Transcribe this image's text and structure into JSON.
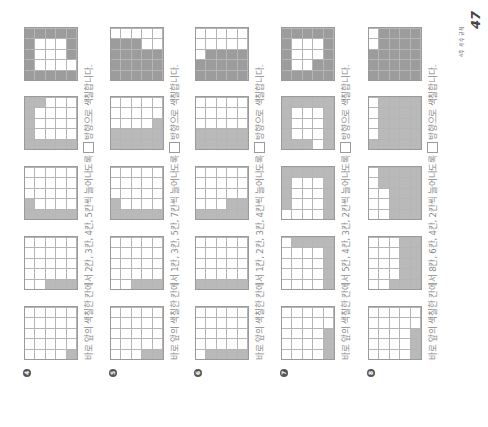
{
  "page": {
    "number": "47",
    "section_label": "4주 개수 규칙"
  },
  "problems": [
    {
      "number": "4",
      "text_before": "바로 앞의 색칠한 칸에서 2칸, 3칸, 4칸, 5칸씩 늘어나도록",
      "direction_icon": "spiral-clockwise-icon",
      "text_after": "방향으로 색칠합니다.",
      "grids": [
        [
          [
            0,
            0,
            0,
            0,
            0
          ],
          [
            0,
            0,
            0,
            0,
            0
          ],
          [
            0,
            0,
            0,
            0,
            0
          ],
          [
            0,
            0,
            0,
            0,
            0
          ],
          [
            1,
            0,
            0,
            0,
            0
          ]
        ],
        [
          [
            0,
            0,
            0,
            0,
            0
          ],
          [
            0,
            0,
            0,
            0,
            0
          ],
          [
            1,
            0,
            0,
            0,
            0
          ],
          [
            1,
            0,
            0,
            0,
            0
          ],
          [
            1,
            0,
            0,
            0,
            0
          ]
        ],
        [
          [
            1,
            1,
            0,
            0,
            0
          ],
          [
            1,
            0,
            0,
            0,
            0
          ],
          [
            1,
            0,
            0,
            0,
            0
          ],
          [
            1,
            0,
            0,
            0,
            0
          ],
          [
            1,
            0,
            0,
            0,
            0
          ]
        ],
        [
          [
            1,
            1,
            1,
            1,
            1
          ],
          [
            1,
            0,
            0,
            0,
            1
          ],
          [
            1,
            0,
            0,
            0,
            0
          ],
          [
            1,
            0,
            0,
            0,
            0
          ],
          [
            1,
            0,
            0,
            0,
            0
          ]
        ],
        [
          [
            2,
            2,
            2,
            2,
            2
          ],
          [
            2,
            0,
            0,
            0,
            2
          ],
          [
            2,
            0,
            0,
            0,
            2
          ],
          [
            2,
            0,
            0,
            0,
            2
          ],
          [
            2,
            0,
            2,
            2,
            2
          ]
        ]
      ]
    },
    {
      "number": "5",
      "text_before": "바로 앞의 색칠한 칸에서 1칸, 3칸, 5칸, 7칸씩 늘어나도록",
      "direction_icon": "zigzag-up-icon",
      "text_after": "방향으로 색칠합니다.",
      "grids": [
        [
          [
            0,
            0,
            0,
            0,
            0
          ],
          [
            0,
            0,
            0,
            0,
            0
          ],
          [
            0,
            0,
            0,
            0,
            0
          ],
          [
            1,
            0,
            0,
            0,
            0
          ],
          [
            1,
            0,
            0,
            0,
            0
          ]
        ],
        [
          [
            0,
            0,
            0,
            0,
            0
          ],
          [
            0,
            0,
            0,
            0,
            0
          ],
          [
            1,
            0,
            0,
            0,
            0
          ],
          [
            1,
            0,
            0,
            0,
            0
          ],
          [
            1,
            0,
            0,
            0,
            0
          ]
        ],
        [
          [
            1,
            1,
            0,
            0,
            0
          ],
          [
            1,
            0,
            0,
            0,
            0
          ],
          [
            1,
            0,
            0,
            0,
            0
          ],
          [
            1,
            0,
            0,
            0,
            0
          ],
          [
            1,
            0,
            0,
            0,
            0
          ]
        ],
        [
          [
            1,
            1,
            0,
            0,
            0
          ],
          [
            1,
            1,
            0,
            0,
            0
          ],
          [
            1,
            1,
            0,
            0,
            0
          ],
          [
            1,
            1,
            0,
            0,
            0
          ],
          [
            1,
            1,
            1,
            0,
            0
          ]
        ],
        [
          [
            2,
            2,
            2,
            2,
            0
          ],
          [
            2,
            2,
            2,
            2,
            0
          ],
          [
            2,
            2,
            2,
            2,
            0
          ],
          [
            2,
            2,
            2,
            0,
            0
          ],
          [
            2,
            2,
            2,
            0,
            0
          ]
        ]
      ]
    },
    {
      "number": "6",
      "text_before": "바로 앞의 색칠한 칸에서 1칸, 2칸, 3칸, 4칸씩 늘어나도록",
      "direction_icon": "zigzag-icon",
      "text_after": "방향으로 색칠합니다.",
      "grids": [
        [
          [
            0,
            0,
            0,
            0,
            0
          ],
          [
            1,
            0,
            0,
            0,
            0
          ],
          [
            1,
            0,
            0,
            0,
            0
          ],
          [
            1,
            0,
            0,
            0,
            0
          ],
          [
            1,
            0,
            0,
            0,
            0
          ]
        ],
        [
          [
            1,
            0,
            0,
            0,
            0
          ],
          [
            1,
            0,
            0,
            0,
            0
          ],
          [
            1,
            0,
            0,
            0,
            0
          ],
          [
            1,
            0,
            0,
            0,
            0
          ],
          [
            1,
            0,
            0,
            0,
            0
          ]
        ],
        [
          [
            1,
            0,
            0,
            0,
            0
          ],
          [
            1,
            0,
            0,
            0,
            0
          ],
          [
            1,
            0,
            0,
            0,
            0
          ],
          [
            1,
            1,
            0,
            0,
            0
          ],
          [
            1,
            1,
            0,
            0,
            0
          ]
        ],
        [
          [
            1,
            1,
            0,
            0,
            0
          ],
          [
            1,
            1,
            0,
            0,
            0
          ],
          [
            1,
            1,
            0,
            0,
            0
          ],
          [
            1,
            1,
            0,
            0,
            0
          ],
          [
            1,
            1,
            0,
            0,
            0
          ]
        ],
        [
          [
            2,
            2,
            0,
            0,
            0
          ],
          [
            2,
            2,
            2,
            0,
            0
          ],
          [
            2,
            2,
            2,
            0,
            0
          ],
          [
            2,
            2,
            2,
            0,
            0
          ],
          [
            2,
            2,
            2,
            0,
            0
          ]
        ]
      ]
    },
    {
      "number": "7",
      "text_before": "바로 앞의 색칠한 칸에서 5칸, 4칸, 3칸, 2칸씩 늘어나도록",
      "direction_icon": "spiral-counterclockwise-icon",
      "text_after": "방향으로 색칠합니다.",
      "grids": [
        [
          [
            0,
            0,
            0,
            0,
            0
          ],
          [
            0,
            0,
            0,
            0,
            0
          ],
          [
            0,
            0,
            0,
            0,
            0
          ],
          [
            0,
            0,
            0,
            0,
            0
          ],
          [
            1,
            1,
            1,
            0,
            0
          ]
        ],
        [
          [
            0,
            0,
            0,
            0,
            0
          ],
          [
            0,
            0,
            0,
            0,
            1
          ],
          [
            0,
            0,
            0,
            0,
            1
          ],
          [
            0,
            0,
            0,
            0,
            1
          ],
          [
            1,
            1,
            1,
            1,
            1
          ]
        ],
        [
          [
            0,
            1,
            1,
            1,
            1
          ],
          [
            0,
            0,
            0,
            0,
            1
          ],
          [
            0,
            0,
            0,
            0,
            1
          ],
          [
            0,
            0,
            0,
            0,
            1
          ],
          [
            1,
            1,
            1,
            1,
            1
          ]
        ],
        [
          [
            1,
            1,
            1,
            1,
            1
          ],
          [
            1,
            0,
            0,
            0,
            1
          ],
          [
            1,
            0,
            0,
            0,
            1
          ],
          [
            0,
            0,
            0,
            0,
            1
          ],
          [
            1,
            1,
            1,
            1,
            1
          ]
        ],
        [
          [
            2,
            2,
            2,
            2,
            2
          ],
          [
            2,
            0,
            0,
            0,
            2
          ],
          [
            2,
            0,
            0,
            0,
            2
          ],
          [
            2,
            2,
            0,
            0,
            2
          ],
          [
            2,
            2,
            2,
            2,
            2
          ]
        ]
      ]
    },
    {
      "number": "8",
      "text_before": "바로 앞의 색칠한 칸에서 8칸, 6칸, 4칸, 2칸씩 늘어나도록",
      "direction_icon": "snake-up-icon",
      "text_after": "방향으로 색칠합니다.",
      "grids": [
        [
          [
            0,
            0,
            0,
            0,
            0
          ],
          [
            0,
            0,
            0,
            0,
            0
          ],
          [
            0,
            0,
            0,
            0,
            0
          ],
          [
            0,
            0,
            0,
            0,
            0
          ],
          [
            1,
            1,
            1,
            0,
            0
          ]
        ],
        [
          [
            0,
            0,
            0,
            0,
            0
          ],
          [
            0,
            0,
            0,
            0,
            0
          ],
          [
            1,
            0,
            0,
            0,
            0
          ],
          [
            1,
            1,
            1,
            1,
            1
          ],
          [
            1,
            1,
            1,
            1,
            1
          ]
        ],
        [
          [
            0,
            0,
            0,
            0,
            0
          ],
          [
            0,
            0,
            0,
            1,
            1
          ],
          [
            1,
            1,
            1,
            1,
            1
          ],
          [
            1,
            1,
            1,
            1,
            1
          ],
          [
            1,
            1,
            1,
            1,
            1
          ]
        ],
        [
          [
            1,
            0,
            0,
            0,
            0
          ],
          [
            1,
            1,
            1,
            1,
            1
          ],
          [
            1,
            1,
            1,
            1,
            1
          ],
          [
            1,
            1,
            1,
            1,
            1
          ],
          [
            1,
            1,
            1,
            1,
            1
          ]
        ],
        [
          [
            2,
            2,
            2,
            0,
            0
          ],
          [
            2,
            2,
            2,
            2,
            2
          ],
          [
            2,
            2,
            2,
            2,
            2
          ],
          [
            2,
            2,
            2,
            2,
            2
          ],
          [
            2,
            2,
            2,
            2,
            2
          ]
        ]
      ]
    }
  ]
}
